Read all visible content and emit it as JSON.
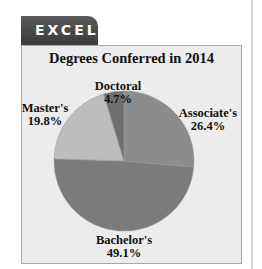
{
  "tab": {
    "label": "EXCEL"
  },
  "chart_data": {
    "type": "pie",
    "title": "Degrees Conferred in 2014",
    "categories": [
      "Associate's",
      "Bachelor's",
      "Master's",
      "Doctoral"
    ],
    "values": [
      26.4,
      49.1,
      19.8,
      4.7
    ],
    "value_labels": [
      "26.4%",
      "49.1%",
      "19.8%",
      "4.7%"
    ],
    "colors": [
      "#8c8c8c",
      "#7b7b7b",
      "#bdbdbd",
      "#6f6f6f"
    ],
    "start_angle_deg": 0,
    "direction": "clockwise",
    "legend": "none (data labels)"
  },
  "labels": {
    "associate": {
      "name": "Associate's",
      "pct": "26.4%"
    },
    "bachelor": {
      "name": "Bachelor's",
      "pct": "49.1%"
    },
    "master": {
      "name": "Master's",
      "pct": "19.8%"
    },
    "doctoral": {
      "name": "Doctoral",
      "pct": "4.7%"
    }
  }
}
